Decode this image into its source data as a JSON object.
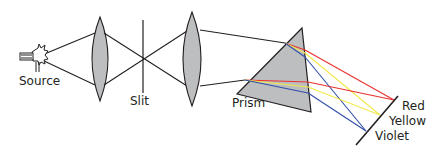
{
  "labels": {
    "source": "Source",
    "slit": "Slit",
    "prism": "Prism",
    "red": "Red",
    "yellow": "Yellow",
    "violet": "Violet"
  },
  "colors": {
    "line": "#231f20",
    "lens_fill": "#bcbec0",
    "prism_fill": "#bcbec0",
    "red": "#e8312f",
    "yellow": "#f2e84b",
    "violet": "#2f4fa8"
  }
}
